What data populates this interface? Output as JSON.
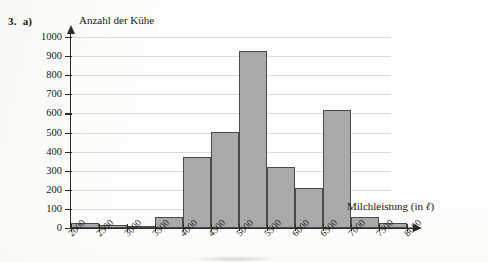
{
  "exercise": {
    "number": "3.",
    "part": "a)"
  },
  "chart_data": {
    "type": "bar",
    "title": "",
    "ylabel": "Anzahl der Kühe",
    "xlabel": "Milchleistung (in ℓ)",
    "xlabel_prefix": "Milchleistung (in ",
    "xlabel_unit": "ℓ",
    "xlabel_suffix": ")",
    "grid": true,
    "legend": "none",
    "bin_width": 500,
    "ylim": [
      0,
      1000
    ],
    "xlim": [
      2000,
      8000
    ],
    "ytick_labels": [
      "1000",
      "900",
      "800",
      "700",
      "600",
      "500",
      "400",
      "300",
      "200",
      "100",
      "0"
    ],
    "ytick_values": [
      1000,
      900,
      800,
      700,
      600,
      500,
      400,
      300,
      200,
      100,
      0
    ],
    "xtick_labels": [
      "2000",
      "2500",
      "3000",
      "3500",
      "4000",
      "4500",
      "5000",
      "5500",
      "6000",
      "6500",
      "7000",
      "7500",
      "8000"
    ],
    "xtick_values": [
      2000,
      2500,
      3000,
      3500,
      4000,
      4500,
      5000,
      5500,
      6000,
      6500,
      7000,
      7500,
      8000
    ],
    "categories": [
      "2000–2500",
      "2500–3000",
      "3000–3500",
      "3500–4000",
      "4000–4500",
      "4500–5000",
      "5000–5500",
      "5500–6000",
      "6000–6500",
      "6500–7000",
      "7000–7500",
      "7500–8000"
    ],
    "values": [
      25,
      15,
      8,
      60,
      370,
      505,
      925,
      318,
      210,
      618,
      55,
      25
    ],
    "bar_color": "#a9a9a9",
    "bar_edge_color": "#4a4a4a",
    "axis_color": "#2b2b2b",
    "grid_color": "#dcdcdc"
  }
}
